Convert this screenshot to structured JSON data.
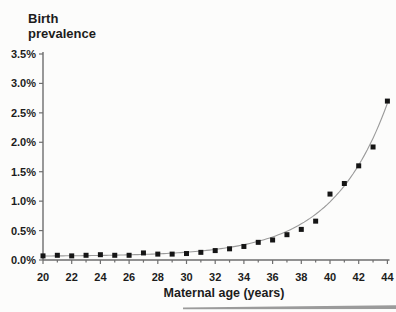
{
  "chart_data": {
    "type": "scatter",
    "title": "",
    "ylabel": "Birth prevalence",
    "ylabel_lines": [
      "Birth",
      "prevalence"
    ],
    "xlabel": "Maternal age (years)",
    "x_axis": {
      "min": 20,
      "max": 44,
      "minor_tick_step": 1,
      "label_step": 2,
      "tick_labels": [
        "20",
        "22",
        "24",
        "26",
        "28",
        "30",
        "32",
        "34",
        "36",
        "38",
        "40",
        "42",
        "44"
      ]
    },
    "y_axis": {
      "min": 0,
      "max": 3.5,
      "tick_step": 0.5,
      "tick_labels": [
        "0.0%",
        "0.5%",
        "1.0%",
        "1.5%",
        "2.0%",
        "2.5%",
        "3.0%",
        "3.5%"
      ]
    },
    "grid": false,
    "legend": false,
    "series": [
      {
        "name": "Observed birth prevalence",
        "marker": "filled-square",
        "x": [
          20,
          21,
          22,
          23,
          24,
          25,
          26,
          27,
          28,
          29,
          30,
          31,
          32,
          33,
          34,
          35,
          36,
          37,
          38,
          39,
          40,
          41,
          42,
          43,
          44
        ],
        "y_pct": [
          0.07,
          0.08,
          0.07,
          0.08,
          0.09,
          0.08,
          0.08,
          0.12,
          0.1,
          0.1,
          0.11,
          0.13,
          0.16,
          0.19,
          0.23,
          0.3,
          0.34,
          0.43,
          0.52,
          0.66,
          1.12,
          1.3,
          1.6,
          1.92,
          2.7
        ]
      }
    ],
    "trend_curve": {
      "name": "Fitted exponential curve",
      "model_pct": "prevalence% = 0.063 + 0.00776 * exp(0.2584 * (age - 21.5))",
      "a": 0.063,
      "b": 0.00776,
      "c": 0.2584,
      "x_offset": 21.5,
      "x_start": 20,
      "x_end": 44.15
    },
    "colors": {
      "points": "#151515",
      "curve": "#9a9a9a",
      "axis": "#6e6e6e",
      "text": "#1c1c1c"
    }
  },
  "decor": {
    "bottom_rule_color": "#9b9b9b"
  }
}
